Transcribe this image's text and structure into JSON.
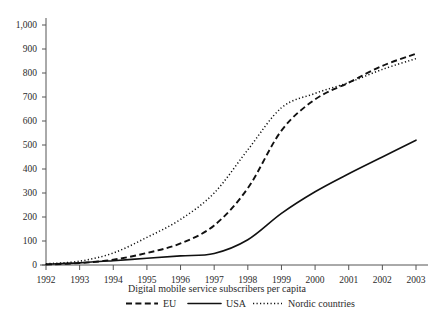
{
  "chart_data": {
    "type": "line",
    "title": "Digital mobile service subscribers per capita",
    "xlabel": "",
    "ylabel": "",
    "grid": false,
    "legend_position": "bottom",
    "x": [
      1992,
      1993,
      1994,
      1995,
      1996,
      1997,
      1998,
      1999,
      2000,
      2001,
      2002,
      2003
    ],
    "xtick_labels": [
      "1992",
      "1993",
      "1994",
      "1995",
      "1996",
      "1997",
      "1998",
      "1999",
      "2000",
      "2001",
      "2002",
      "2003"
    ],
    "ytick_labels": [
      "0",
      "100",
      "200",
      "300",
      "400",
      "500",
      "600",
      "700",
      "800",
      "900",
      "1,000"
    ],
    "ytick_values": [
      0,
      100,
      200,
      300,
      400,
      500,
      600,
      700,
      800,
      900,
      1000
    ],
    "xlim": [
      1992,
      2003
    ],
    "ylim": [
      0,
      1000
    ],
    "series": [
      {
        "name": "EU",
        "style": "dashed",
        "color": "#111111",
        "values": [
          2,
          8,
          22,
          50,
          90,
          165,
          320,
          560,
          690,
          760,
          830,
          880
        ]
      },
      {
        "name": "USA",
        "style": "solid",
        "color": "#111111",
        "values": [
          3,
          9,
          18,
          28,
          38,
          48,
          105,
          215,
          305,
          380,
          450,
          520
        ]
      },
      {
        "name": "Nordic countries",
        "style": "dotted",
        "color": "#111111",
        "values": [
          5,
          16,
          50,
          115,
          190,
          300,
          480,
          655,
          715,
          760,
          815,
          860
        ]
      }
    ]
  },
  "legend": {
    "items": [
      {
        "label": "EU",
        "style": "dashed"
      },
      {
        "label": "USA",
        "style": "solid"
      },
      {
        "label": "Nordic countries",
        "style": "dotted"
      }
    ]
  }
}
